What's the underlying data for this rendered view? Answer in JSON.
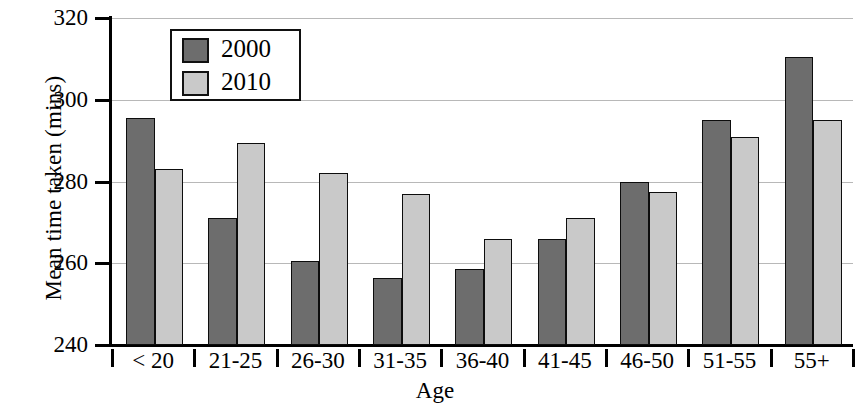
{
  "chart_data": {
    "type": "bar",
    "title": "",
    "xlabel": "Age",
    "ylabel": "Mean time taken (mins)",
    "categories": [
      "< 20",
      "21-25",
      "26-30",
      "31-35",
      "36-40",
      "41-45",
      "46-50",
      "51-55",
      "55+"
    ],
    "series": [
      {
        "name": "2000",
        "color": "#6d6d6d",
        "values": [
          295.5,
          271,
          260.5,
          256.5,
          258.5,
          266,
          280,
          295,
          310.5
        ]
      },
      {
        "name": "2010",
        "color": "#c9c9c9",
        "values": [
          283,
          289.5,
          282,
          277,
          266,
          271,
          277.5,
          291,
          295
        ]
      }
    ],
    "ylim": [
      240,
      320
    ],
    "yticks": [
      240,
      260,
      280,
      300,
      320
    ],
    "ytick_labels": [
      "240",
      "260",
      "280",
      "300",
      "320"
    ],
    "grid": true,
    "grid_axis": "y",
    "legend_position": "top-left-inside"
  },
  "legend": {
    "entries": [
      {
        "label": "2000",
        "color": "#6d6d6d"
      },
      {
        "label": "2010",
        "color": "#c9c9c9"
      }
    ]
  }
}
